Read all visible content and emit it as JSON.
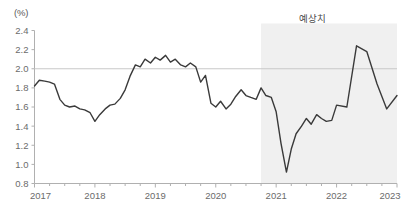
{
  "chart_data": {
    "type": "line",
    "title": "",
    "subtitle": "",
    "xlabel": "",
    "ylabel": "(%)",
    "unit_label": "(%)",
    "ylim": [
      0.8,
      2.4
    ],
    "xlim": [
      2017.0,
      2023.0
    ],
    "ytick_labels": [
      "0.8",
      "1.0",
      "1.2",
      "1.4",
      "1.6",
      "1.8",
      "2.0",
      "2.2",
      "2.4"
    ],
    "ytick_values": [
      0.8,
      1.0,
      1.2,
      1.4,
      1.6,
      1.8,
      2.0,
      2.2,
      2.4
    ],
    "xtick_labels": [
      "2017",
      "2018",
      "2019",
      "2020",
      "2021",
      "2022",
      "2023"
    ],
    "xtick_values": [
      2017,
      2018,
      2019,
      2020,
      2021,
      2022,
      2023
    ],
    "grid": false,
    "legend": "none",
    "reference_line": {
      "value": 2.0,
      "color": "#c8c8c8",
      "label": ""
    },
    "annotations": [
      {
        "text": "예상치",
        "x": 2021.6,
        "y": 2.36,
        "meaning": "forecast"
      }
    ],
    "shaded_region": {
      "label": "예상치",
      "x_start": 2020.75,
      "x_end": 2023.0,
      "color": "#f0f0f0"
    },
    "line_color": "#3a3a3a",
    "line_width": 1.4,
    "series": [
      {
        "name": "",
        "color": "#3a3a3a",
        "x": [
          2017.0,
          2017.08,
          2017.17,
          2017.25,
          2017.33,
          2017.42,
          2017.5,
          2017.58,
          2017.67,
          2017.75,
          2017.83,
          2017.92,
          2018.0,
          2018.08,
          2018.17,
          2018.25,
          2018.33,
          2018.42,
          2018.5,
          2018.58,
          2018.67,
          2018.75,
          2018.83,
          2018.92,
          2019.0,
          2019.08,
          2019.17,
          2019.25,
          2019.33,
          2019.42,
          2019.5,
          2019.58,
          2019.67,
          2019.75,
          2019.83,
          2019.92,
          2020.0,
          2020.08,
          2020.17,
          2020.25,
          2020.33,
          2020.42,
          2020.5,
          2020.58,
          2020.67,
          2020.75,
          2020.83,
          2020.92,
          2021.0,
          2021.08,
          2021.17,
          2021.25,
          2021.33,
          2021.42,
          2021.5,
          2021.58,
          2021.67,
          2021.75,
          2021.83,
          2021.92,
          2022.0,
          2022.17,
          2022.33,
          2022.5,
          2022.67,
          2022.83,
          2023.0
        ],
        "values": [
          1.82,
          1.88,
          1.87,
          1.86,
          1.84,
          1.68,
          1.62,
          1.6,
          1.61,
          1.58,
          1.57,
          1.54,
          1.45,
          1.52,
          1.58,
          1.62,
          1.63,
          1.69,
          1.78,
          1.92,
          2.04,
          2.02,
          2.1,
          2.06,
          2.12,
          2.09,
          2.14,
          2.07,
          2.1,
          2.04,
          2.02,
          2.06,
          2.02,
          1.86,
          1.93,
          1.64,
          1.6,
          1.66,
          1.58,
          1.63,
          1.71,
          1.78,
          1.72,
          1.7,
          1.68,
          1.8,
          1.72,
          1.7,
          1.55,
          1.22,
          0.92,
          1.16,
          1.32,
          1.4,
          1.48,
          1.42,
          1.52,
          1.48,
          1.45,
          1.46,
          1.62,
          1.6,
          2.24,
          2.18,
          1.84,
          1.58,
          1.72
        ]
      }
    ],
    "series_notes": "Monthly values; the region from late 2020 onward is shaded as forecast (예상치). The line flattens near 1.72 from 2022 through 2023."
  },
  "source": {
    "text": ""
  }
}
